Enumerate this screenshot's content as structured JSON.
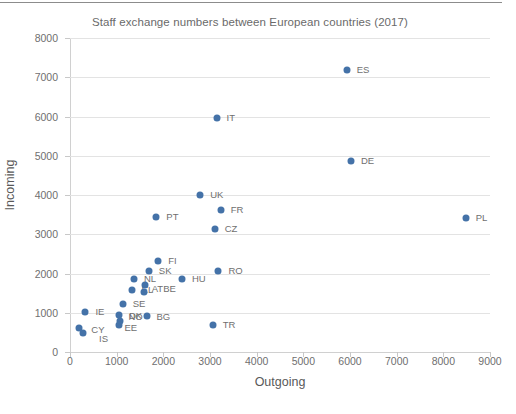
{
  "chart_data": {
    "type": "scatter",
    "title": "Staff exchange numbers between European countries (2017)",
    "xlabel": "Outgoing",
    "ylabel": "Incoming",
    "xlim": [
      0,
      9000
    ],
    "ylim": [
      0,
      8000
    ],
    "xticks": [
      0,
      1000,
      2000,
      3000,
      4000,
      5000,
      6000,
      7000,
      8000,
      9000
    ],
    "yticks": [
      0,
      1000,
      2000,
      3000,
      4000,
      5000,
      6000,
      7000,
      8000
    ],
    "grid": "horizontal",
    "legend": "none",
    "marker_color": "#4472a8",
    "points": [
      {
        "label": "ES",
        "x": 5930,
        "y": 7180,
        "lx": 10,
        "ly": -5
      },
      {
        "label": "IT",
        "x": 3140,
        "y": 5970,
        "lx": 10,
        "ly": -5
      },
      {
        "label": "DE",
        "x": 6020,
        "y": 4860,
        "lx": 10,
        "ly": -5
      },
      {
        "label": "UK",
        "x": 2790,
        "y": 4000,
        "lx": 10,
        "ly": -5
      },
      {
        "label": "FR",
        "x": 3230,
        "y": 3620,
        "lx": 10,
        "ly": -5
      },
      {
        "label": "PL",
        "x": 8480,
        "y": 3420,
        "lx": 10,
        "ly": -5
      },
      {
        "label": "PT",
        "x": 1850,
        "y": 3450,
        "lx": 10,
        "ly": -5
      },
      {
        "label": "CZ",
        "x": 3100,
        "y": 3130,
        "lx": 10,
        "ly": -5
      },
      {
        "label": "FI",
        "x": 1890,
        "y": 2320,
        "lx": 10,
        "ly": -5
      },
      {
        "label": "SK",
        "x": 1690,
        "y": 2060,
        "lx": 10,
        "ly": -5
      },
      {
        "label": "RO",
        "x": 3180,
        "y": 2060,
        "lx": 10,
        "ly": -5
      },
      {
        "label": "HU",
        "x": 2400,
        "y": 1850,
        "lx": 10,
        "ly": -5
      },
      {
        "label": "NL",
        "x": 1370,
        "y": 1870,
        "lx": 10,
        "ly": -5
      },
      {
        "label": "EL",
        "x": 1320,
        "y": 1570,
        "lx": 10,
        "ly": -5
      },
      {
        "label": "AT",
        "x": 1580,
        "y": 1530,
        "lx": 8,
        "ly": -8
      },
      {
        "label": "BE",
        "x": 1610,
        "y": 1700,
        "lx": 18,
        "ly": -1
      },
      {
        "label": "SE",
        "x": 1130,
        "y": 1230,
        "lx": 10,
        "ly": -5
      },
      {
        "label": "BG",
        "x": 1640,
        "y": 920,
        "lx": 10,
        "ly": -4
      },
      {
        "label": "DK",
        "x": 1050,
        "y": 940,
        "lx": 10,
        "ly": -4
      },
      {
        "label": "NO",
        "x": 1080,
        "y": 790,
        "lx": 8,
        "ly": -9
      },
      {
        "label": "EE",
        "x": 1040,
        "y": 680,
        "lx": 6,
        "ly": -2
      },
      {
        "label": "IE",
        "x": 330,
        "y": 1030,
        "lx": 10,
        "ly": -5
      },
      {
        "label": "CY",
        "x": 200,
        "y": 610,
        "lx": 12,
        "ly": -3
      },
      {
        "label": "IS",
        "x": 280,
        "y": 490,
        "lx": 16,
        "ly": 1
      },
      {
        "label": "TR",
        "x": 3060,
        "y": 700,
        "lx": 10,
        "ly": -5
      }
    ]
  }
}
